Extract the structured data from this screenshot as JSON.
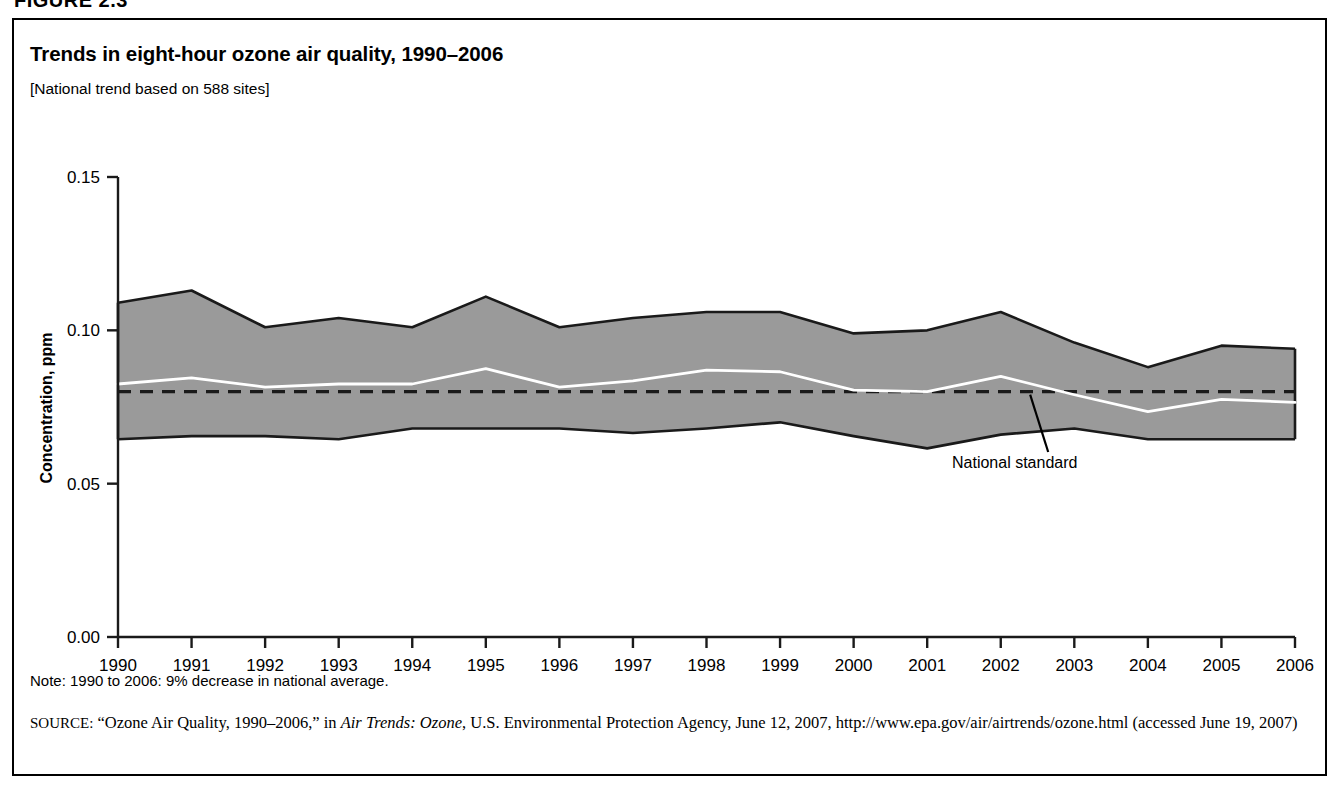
{
  "figure": {
    "label": "FIGURE 2.3"
  },
  "chart_title": "Trends in eight-hour ozone air quality, 1990–2006",
  "chart_subtitle": "[National trend based on 588 sites]",
  "note": "Note: 1990 to 2006: 9% decrease in national average.",
  "source": {
    "prefix": "SOURCE:",
    "part1": " “Ozone Air Quality, 1990–2006,” in ",
    "italic1": "Air Trends: Ozone",
    "part2": ", U.S. Environmental Protection Agency, June 12, 2007, http://www.epa.gov/air/airtrends/ozone.html (accessed June 19, 2007)"
  },
  "colors": {
    "band_fill": "#9a9a9a",
    "band_outline": "#1a1a1a",
    "mean_line": "#ffffff",
    "standard_line": "#1a1a1a",
    "axis": "#1a1a1a",
    "text": "#000000",
    "page_background": "#ffffff"
  },
  "chart_data": {
    "type": "area",
    "title": "Trends in eight-hour ozone air quality, 1990–2006",
    "subtitle": "[National trend based on 588 sites]",
    "xlabel": "",
    "ylabel": "Concentration, ppm",
    "ylim": [
      0.0,
      0.15
    ],
    "yticks": [
      0.0,
      0.05,
      0.1,
      0.15
    ],
    "ytick_labels": [
      "0.00",
      "0.05",
      "0.10",
      "0.15"
    ],
    "grid": false,
    "legend": "none",
    "x": [
      1990,
      1991,
      1992,
      1993,
      1994,
      1995,
      1996,
      1997,
      1998,
      1999,
      2000,
      2001,
      2002,
      2003,
      2004,
      2005,
      2006
    ],
    "xtick_labels": [
      "1990",
      "1991",
      "1992",
      "1993",
      "1994",
      "1995",
      "1996",
      "1997",
      "1998",
      "1999",
      "2000",
      "2001",
      "2002",
      "2003",
      "2004",
      "2005",
      "2006"
    ],
    "series": [
      {
        "name": "90th percentile (upper band)",
        "values": [
          0.109,
          0.113,
          0.101,
          0.104,
          0.101,
          0.111,
          0.101,
          0.104,
          0.106,
          0.106,
          0.099,
          0.1,
          0.106,
          0.096,
          0.088,
          0.095,
          0.094
        ]
      },
      {
        "name": "National average (mean line)",
        "values": [
          0.0825,
          0.0845,
          0.0815,
          0.0825,
          0.0825,
          0.0875,
          0.0815,
          0.0835,
          0.087,
          0.0865,
          0.0805,
          0.08,
          0.085,
          0.079,
          0.0735,
          0.0775,
          0.0765
        ]
      },
      {
        "name": "10th percentile (lower band)",
        "values": [
          0.0645,
          0.0655,
          0.0655,
          0.0645,
          0.068,
          0.068,
          0.068,
          0.0665,
          0.068,
          0.07,
          0.0655,
          0.0615,
          0.066,
          0.068,
          0.0645,
          0.0645,
          0.0645
        ]
      }
    ],
    "reference_line": {
      "label": "National standard",
      "value": 0.08,
      "style": "dashed"
    },
    "annotations": [
      {
        "text": "National standard",
        "target_x": 2002.4,
        "target_y": 0.08
      }
    ]
  },
  "axis": {
    "y_title": "Concentration, ppm"
  }
}
